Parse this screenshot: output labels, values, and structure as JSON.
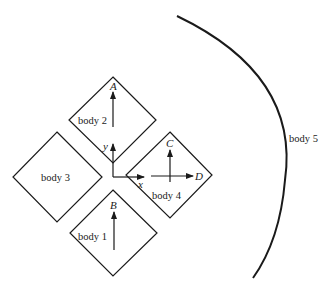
{
  "diagram": {
    "bodies": [
      {
        "id": "body1",
        "label": "body 1"
      },
      {
        "id": "body2",
        "label": "body 2"
      },
      {
        "id": "body3",
        "label": "body 3"
      },
      {
        "id": "body4",
        "label": "body 4"
      },
      {
        "id": "body5",
        "label": "body 5"
      }
    ],
    "points": {
      "A": "A",
      "B": "B",
      "C": "C",
      "D": "D"
    },
    "axes": {
      "x": "x",
      "y": "y"
    },
    "stroke_color": "#1a1a1a"
  }
}
